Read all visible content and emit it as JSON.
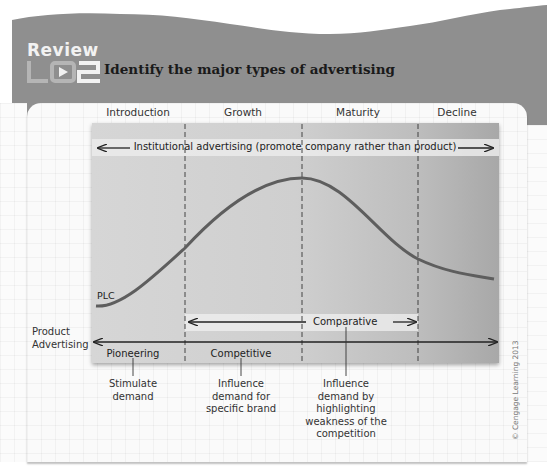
{
  "header": {
    "review_label": "Review",
    "badge": "LO2",
    "title": "Identify the major types of advertising"
  },
  "diagram": {
    "stages": [
      "Introduction",
      "Growth",
      "Maturity",
      "Decline"
    ],
    "institutional_label": "Institutional advertising (promote company rather than product)",
    "curve_label": "PLC",
    "product_advertising_label_line1": "Product",
    "product_advertising_label_line2": "Advertising",
    "comparative_label": "Comparative",
    "phase_labels": [
      "Pioneering",
      "Competitive"
    ],
    "descriptions": [
      {
        "lines": [
          "Stimulate",
          "demand"
        ]
      },
      {
        "lines": [
          "Influence",
          "demand for",
          "specific brand"
        ]
      },
      {
        "lines": [
          "Influence",
          "demand by",
          "highlighting",
          "weakness of the",
          "competition"
        ]
      }
    ],
    "credit": "© Cengage Learning 2013"
  },
  "colors": {
    "header_gray": "#8f8f8f",
    "curve": "#5e5e5e",
    "panel": "#fafafa"
  }
}
